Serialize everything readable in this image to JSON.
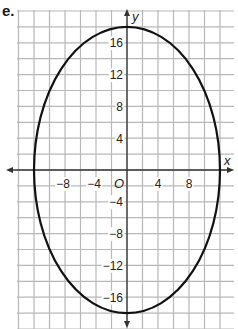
{
  "problem_label": "e.",
  "chart_data": {
    "type": "line",
    "title": "",
    "xlabel": "x",
    "ylabel": "y",
    "origin_label": "O",
    "shape": "ellipse",
    "center": [
      0,
      0
    ],
    "semi_axis_x": 12,
    "semi_axis_y": 18,
    "equation": "x^2/144 + y^2/324 = 1",
    "xlim": [
      -14,
      14
    ],
    "ylim": [
      -20,
      20
    ],
    "grid": true,
    "grid_step": 2,
    "x_ticks": [
      -8,
      -4,
      4,
      8
    ],
    "y_ticks": [
      16,
      12,
      8,
      4,
      -4,
      -8,
      -12,
      -16
    ],
    "x_tick_labels": [
      "−8",
      "−4",
      "4",
      "8"
    ],
    "y_tick_labels": [
      "16",
      "12",
      "8",
      "4",
      "−4",
      "−8",
      "−12",
      "−16"
    ],
    "vertices": [
      [
        0,
        18
      ],
      [
        0,
        -18
      ],
      [
        12,
        0
      ],
      [
        -12,
        0
      ]
    ]
  },
  "colors": {
    "grid": "#b8b8b8",
    "curve": "#111111",
    "axis": "#333333"
  }
}
